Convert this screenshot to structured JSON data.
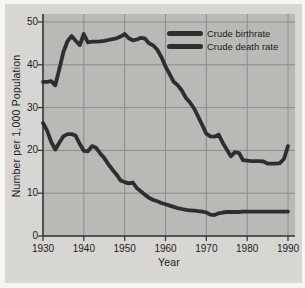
{
  "figure": {
    "colors": {
      "outer_background": "#f6f5f2",
      "panel_background": "#d8d6d2",
      "plot_background": "#b9b9b5",
      "gridline": "#8b8b89",
      "axis": "#3a3a38",
      "line": "#2e2e2c",
      "text": "#1b1b1b"
    }
  },
  "chart_data": {
    "type": "line",
    "title": "",
    "xlabel": "Year",
    "ylabel": "Number per 1,000 Population",
    "xlim": [
      1930,
      1990
    ],
    "ylim": [
      0,
      50
    ],
    "x_ticks": [
      1930,
      1940,
      1950,
      1960,
      1970,
      1980,
      1990
    ],
    "y_ticks": [
      0,
      10,
      20,
      30,
      40,
      50
    ],
    "grid": true,
    "legend_position": "top-right",
    "series": [
      {
        "name": "Crude birthrate",
        "color": "#2e2e2c",
        "points": [
          [
            1930,
            36.0
          ],
          [
            1931,
            36.0
          ],
          [
            1932,
            36.2
          ],
          [
            1933,
            35.2
          ],
          [
            1934,
            39.0
          ],
          [
            1935,
            43.0
          ],
          [
            1936,
            45.5
          ],
          [
            1937,
            46.7
          ],
          [
            1938,
            45.6
          ],
          [
            1939,
            44.6
          ],
          [
            1940,
            47.2
          ],
          [
            1941,
            45.2
          ],
          [
            1942,
            45.4
          ],
          [
            1943,
            45.4
          ],
          [
            1944,
            45.5
          ],
          [
            1945,
            45.6
          ],
          [
            1946,
            45.8
          ],
          [
            1947,
            46.0
          ],
          [
            1948,
            46.2
          ],
          [
            1949,
            46.6
          ],
          [
            1950,
            47.2
          ],
          [
            1951,
            46.2
          ],
          [
            1952,
            45.7
          ],
          [
            1953,
            45.9
          ],
          [
            1954,
            46.3
          ],
          [
            1955,
            46.1
          ],
          [
            1956,
            45.0
          ],
          [
            1957,
            44.5
          ],
          [
            1958,
            43.5
          ],
          [
            1959,
            41.8
          ],
          [
            1960,
            39.6
          ],
          [
            1961,
            37.8
          ],
          [
            1962,
            36.0
          ],
          [
            1963,
            35.2
          ],
          [
            1964,
            34.0
          ],
          [
            1965,
            32.3
          ],
          [
            1966,
            31.2
          ],
          [
            1967,
            29.8
          ],
          [
            1968,
            27.9
          ],
          [
            1969,
            25.9
          ],
          [
            1970,
            23.9
          ],
          [
            1971,
            23.3
          ],
          [
            1972,
            23.2
          ],
          [
            1973,
            23.7
          ],
          [
            1974,
            21.8
          ],
          [
            1975,
            20.2
          ],
          [
            1976,
            18.6
          ],
          [
            1977,
            19.6
          ],
          [
            1978,
            19.4
          ],
          [
            1979,
            17.7
          ],
          [
            1980,
            17.6
          ],
          [
            1981,
            17.5
          ],
          [
            1982,
            17.5
          ],
          [
            1983,
            17.5
          ],
          [
            1984,
            17.4
          ],
          [
            1985,
            16.9
          ],
          [
            1986,
            16.9
          ],
          [
            1987,
            16.9
          ],
          [
            1988,
            17.0
          ],
          [
            1989,
            18.0
          ],
          [
            1990,
            21.0
          ]
        ]
      },
      {
        "name": "Crude death rate",
        "color": "#2e2e2c",
        "points": [
          [
            1930,
            26.4
          ],
          [
            1931,
            24.6
          ],
          [
            1932,
            22.0
          ],
          [
            1933,
            20.2
          ],
          [
            1934,
            21.8
          ],
          [
            1935,
            23.3
          ],
          [
            1936,
            23.8
          ],
          [
            1937,
            23.8
          ],
          [
            1938,
            23.4
          ],
          [
            1939,
            21.5
          ],
          [
            1940,
            19.9
          ],
          [
            1941,
            19.8
          ],
          [
            1942,
            21.0
          ],
          [
            1943,
            20.6
          ],
          [
            1944,
            19.3
          ],
          [
            1945,
            18.2
          ],
          [
            1946,
            16.8
          ],
          [
            1947,
            15.5
          ],
          [
            1948,
            14.4
          ],
          [
            1949,
            13.0
          ],
          [
            1950,
            12.6
          ],
          [
            1951,
            12.3
          ],
          [
            1952,
            12.5
          ],
          [
            1953,
            11.2
          ],
          [
            1954,
            10.4
          ],
          [
            1955,
            9.6
          ],
          [
            1956,
            8.9
          ],
          [
            1957,
            8.4
          ],
          [
            1958,
            8.1
          ],
          [
            1959,
            7.7
          ],
          [
            1960,
            7.4
          ],
          [
            1961,
            7.1
          ],
          [
            1962,
            6.8
          ],
          [
            1963,
            6.5
          ],
          [
            1964,
            6.3
          ],
          [
            1965,
            6.1
          ],
          [
            1966,
            6.0
          ],
          [
            1967,
            5.9
          ],
          [
            1968,
            5.8
          ],
          [
            1969,
            5.7
          ],
          [
            1970,
            5.5
          ],
          [
            1971,
            5.0
          ],
          [
            1972,
            4.9
          ],
          [
            1973,
            5.3
          ],
          [
            1974,
            5.5
          ],
          [
            1975,
            5.6
          ],
          [
            1976,
            5.6
          ],
          [
            1977,
            5.6
          ],
          [
            1978,
            5.6
          ],
          [
            1979,
            5.7
          ],
          [
            1980,
            5.7
          ],
          [
            1981,
            5.7
          ],
          [
            1982,
            5.7
          ],
          [
            1983,
            5.7
          ],
          [
            1984,
            5.7
          ],
          [
            1985,
            5.7
          ],
          [
            1986,
            5.7
          ],
          [
            1987,
            5.7
          ],
          [
            1988,
            5.7
          ],
          [
            1989,
            5.7
          ],
          [
            1990,
            5.7
          ]
        ]
      }
    ]
  }
}
